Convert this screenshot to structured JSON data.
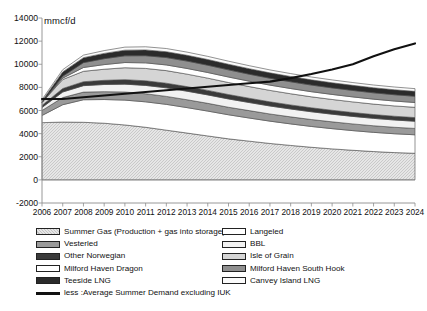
{
  "axis_unit_label": "mmcf/d",
  "legend": {
    "left_column": [
      {
        "label": "Summer Gas (Production + gas into storage)",
        "swatch": "hatch-light",
        "color": "#e8e8e8"
      },
      {
        "label": "Vesterled",
        "swatch": "solid",
        "color": "#9a9a9a"
      },
      {
        "label": "Other Norwegian",
        "swatch": "solid",
        "color": "#3a3a3a"
      },
      {
        "label": "Milford Haven Dragon",
        "swatch": "solid",
        "color": "#ffffff"
      },
      {
        "label": "Teeside LNG",
        "swatch": "solid",
        "color": "#2b2b2b"
      },
      {
        "label": "less :Average Summer Demand excluding IUK",
        "swatch": "line",
        "color": "#111111"
      }
    ],
    "right_column": [
      {
        "label": "Langeled",
        "swatch": "solid",
        "color": "#ffffff"
      },
      {
        "label": "BBL",
        "swatch": "solid",
        "color": "#f2f2f2"
      },
      {
        "label": "Isle of Grain",
        "swatch": "solid",
        "color": "#d5d5d5"
      },
      {
        "label": "Milford Haven South Hook",
        "swatch": "solid",
        "color": "#8f8f8f"
      },
      {
        "label": "Canvey Island LNG",
        "swatch": "solid",
        "color": "#fbfbfb"
      }
    ]
  },
  "chart_data": {
    "type": "area",
    "title": "",
    "subtitle": "",
    "xlabel": "",
    "ylabel": "mmcf/d",
    "ylim": [
      -2000,
      14000
    ],
    "ytick_values": [
      -2000,
      0,
      2000,
      4000,
      6000,
      8000,
      10000,
      12000,
      14000
    ],
    "ytick_labels": [
      "-2000",
      "0",
      "2000",
      "4000",
      "6000",
      "8000",
      "10000",
      "12000",
      "14000"
    ],
    "grid": false,
    "legend_position": "bottom",
    "stacked": true,
    "categories": [
      2006,
      2007,
      2008,
      2009,
      2010,
      2011,
      2012,
      2013,
      2014,
      2015,
      2016,
      2017,
      2018,
      2019,
      2020,
      2021,
      2022,
      2023,
      2024
    ],
    "xtick_labels": [
      "2006",
      "2007",
      "2008",
      "2009",
      "2010",
      "2011",
      "2012",
      "2013",
      "2014",
      "2015",
      "2016",
      "2017",
      "2018",
      "2019",
      "2020",
      "2021",
      "2022",
      "2023",
      "2024"
    ],
    "series": [
      {
        "name": "Summer Gas (Production + gas into storage)",
        "color": "#dedede",
        "pattern": "hatch",
        "values": [
          4950,
          5000,
          4980,
          4900,
          4750,
          4550,
          4300,
          4050,
          3800,
          3550,
          3350,
          3150,
          2980,
          2820,
          2680,
          2560,
          2450,
          2360,
          2300
        ]
      },
      {
        "name": "Langeled",
        "color": "#ffffff",
        "pattern": "solid",
        "values": [
          620,
          1500,
          1950,
          2050,
          2150,
          2200,
          2230,
          2200,
          2150,
          2080,
          2000,
          1930,
          1860,
          1800,
          1750,
          1700,
          1660,
          1630,
          1600
        ]
      },
      {
        "name": "Vesterled",
        "color": "#9a9a9a",
        "pattern": "solid",
        "values": [
          430,
          620,
          660,
          680,
          700,
          700,
          690,
          680,
          670,
          650,
          640,
          620,
          610,
          600,
          590,
          580,
          570,
          560,
          550
        ]
      },
      {
        "name": "BBL",
        "color": "#f2f2f2",
        "pattern": "solid",
        "values": [
          260,
          480,
          560,
          620,
          680,
          720,
          740,
          740,
          730,
          720,
          700,
          690,
          680,
          670,
          660,
          650,
          640,
          630,
          620
        ]
      },
      {
        "name": "Other Norwegian",
        "color": "#3a3a3a",
        "pattern": "solid",
        "values": [
          180,
          300,
          340,
          360,
          390,
          400,
          400,
          395,
          390,
          380,
          370,
          360,
          350,
          345,
          340,
          335,
          330,
          325,
          320
        ]
      },
      {
        "name": "Isle of Grain",
        "color": "#d5d5d5",
        "pattern": "solid",
        "values": [
          260,
          780,
          900,
          960,
          1030,
          1070,
          1090,
          1080,
          1060,
          1040,
          1010,
          990,
          970,
          950,
          935,
          920,
          905,
          895,
          885
        ]
      },
      {
        "name": "Milford Haven Dragon",
        "color": "#ffffff",
        "pattern": "solid",
        "values": [
          0,
          120,
          330,
          400,
          450,
          480,
          490,
          490,
          485,
          475,
          465,
          455,
          450,
          440,
          435,
          430,
          425,
          420,
          415
        ]
      },
      {
        "name": "Milford Haven South Hook",
        "color": "#8f8f8f",
        "pattern": "solid",
        "values": [
          0,
          160,
          420,
          510,
          580,
          620,
          640,
          640,
          630,
          620,
          605,
          595,
          585,
          575,
          565,
          560,
          550,
          545,
          540
        ]
      },
      {
        "name": "Teeside LNG",
        "color": "#2b2b2b",
        "pattern": "solid",
        "values": [
          130,
          380,
          430,
          460,
          490,
          500,
          505,
          500,
          495,
          485,
          475,
          465,
          458,
          450,
          445,
          440,
          435,
          430,
          425
        ]
      },
      {
        "name": "Canvey Island LNG",
        "color": "#fbfbfb",
        "pattern": "solid",
        "values": [
          120,
          190,
          220,
          240,
          260,
          270,
          275,
          275,
          270,
          265,
          260,
          255,
          250,
          248,
          245,
          242,
          240,
          238,
          235
        ]
      }
    ],
    "line_series": {
      "name": "less :Average Summer Demand excluding IUK",
      "color": "#111111",
      "values": [
        7000,
        7000,
        7150,
        7300,
        7450,
        7600,
        7750,
        7900,
        8050,
        8200,
        8350,
        8500,
        8800,
        9150,
        9550,
        10000,
        10700,
        11300,
        11800
      ]
    }
  }
}
